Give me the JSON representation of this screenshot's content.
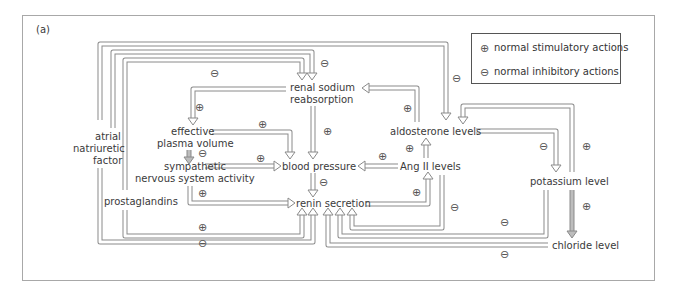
{
  "panel_label": "(a)",
  "legend": {
    "items": [
      {
        "symbol": "⊕",
        "label": "normal stimulatory actions"
      },
      {
        "symbol": "⊖",
        "label": "normal inhibitory actions"
      }
    ]
  },
  "nodes": {
    "renal_sodium": [
      "renal sodium",
      "reabsorption"
    ],
    "effective_plasma": [
      "effective",
      "plasma volume"
    ],
    "sympathetic": [
      "sympathetic",
      "nervous system activity"
    ],
    "blood_pressure": "blood pressure",
    "renin_secretion": "renin secretion",
    "aldosterone": "aldosterone levels",
    "ang2": "Ang II levels",
    "potassium": "potassium level",
    "chloride": "chloride level",
    "anf": [
      "atrial",
      "natriuretic",
      "factor"
    ],
    "prostaglandins": "prostaglandins"
  },
  "signs": {
    "plus": "⊕",
    "minus": "⊖"
  },
  "colors": {
    "arrow_stroke": "#8a8a8a",
    "arrow_fill": "#ffffff",
    "text": "#3a3a3a",
    "frame": "#aaaaaa"
  }
}
